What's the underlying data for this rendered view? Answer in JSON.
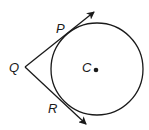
{
  "diagram": {
    "type": "circle-with-tangents",
    "labels": {
      "center": "C",
      "external_point": "Q",
      "tangent_point_upper": "P",
      "tangent_point_lower": "R"
    },
    "circle": {
      "cx": 97,
      "cy": 69,
      "r": 46
    },
    "points": {
      "Q": {
        "x": 25,
        "y": 67
      },
      "P": {
        "x": 60,
        "y": 39
      },
      "R": {
        "x": 65,
        "y": 106
      },
      "C": {
        "x": 96,
        "y": 70
      }
    },
    "rays": [
      {
        "from": "Q",
        "through": "P",
        "arrow_tip": {
          "x": 95,
          "y": 11
        }
      },
      {
        "from": "Q",
        "through": "R",
        "arrow_tip": {
          "x": 87,
          "y": 125
        }
      }
    ],
    "stroke_color": "#1a1a1a"
  }
}
